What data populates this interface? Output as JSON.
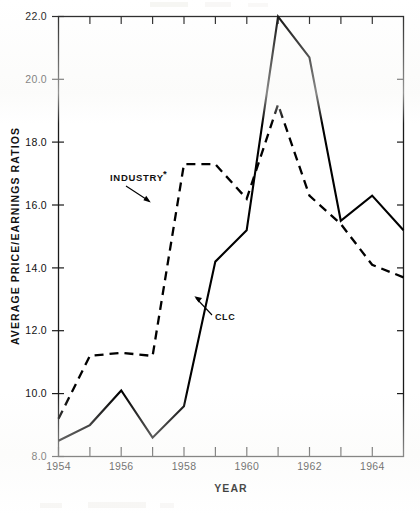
{
  "figure": {
    "kind": "scanned-line-chart",
    "background_color": "#ffffff",
    "ink_color": "#000000"
  },
  "axes": {
    "x_title": "YEAR",
    "y_title": "AVERAGE  PRICE/EARNINGS  RATIOS",
    "x_tick_labels": [
      "1954",
      "1956",
      "1958",
      "1960",
      "1962",
      "1964"
    ],
    "y_tick_labels": [
      "8.0",
      "10.0",
      "12.0",
      "14.0",
      "16.0",
      "18.0",
      "20.0",
      "22.0"
    ]
  },
  "annotations": {
    "industry_label": "INDUSTRY",
    "industry_superscript": "*",
    "clc_label": "CLC"
  },
  "chart_data": {
    "type": "line",
    "title": "",
    "xlabel": "YEAR",
    "ylabel": "AVERAGE PRICE/EARNINGS RATIOS",
    "xlim": [
      1954,
      1965
    ],
    "ylim": [
      8.0,
      22.0
    ],
    "x_ticks": [
      1954,
      1955,
      1956,
      1957,
      1958,
      1959,
      1960,
      1961,
      1962,
      1963,
      1964,
      1965
    ],
    "x_tick_labels_shown": [
      1954,
      1956,
      1958,
      1960,
      1962,
      1964
    ],
    "y_ticks": [
      8.0,
      10.0,
      12.0,
      14.0,
      16.0,
      18.0,
      20.0,
      22.0
    ],
    "grid": false,
    "legend": "inline-annotations",
    "x": [
      1954,
      1955,
      1956,
      1957,
      1958,
      1959,
      1960,
      1961,
      1962,
      1963,
      1964,
      1965
    ],
    "series": [
      {
        "name": "CLC",
        "style": "solid",
        "values": [
          8.5,
          9.0,
          10.1,
          8.6,
          9.6,
          14.2,
          15.2,
          22.0,
          20.7,
          15.5,
          16.3,
          15.2
        ]
      },
      {
        "name": "INDUSTRY*",
        "style": "dashed",
        "values": [
          9.2,
          11.2,
          11.3,
          11.2,
          17.3,
          17.3,
          16.2,
          19.2,
          16.3,
          15.4,
          14.1,
          13.7
        ]
      }
    ]
  }
}
